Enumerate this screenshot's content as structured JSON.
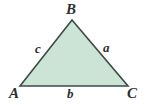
{
  "figure": {
    "kind": "geometry-diagram",
    "shape": "triangle",
    "width": 146,
    "height": 105,
    "background_color": "#ffffff",
    "fill_color": "#cce4d6",
    "stroke_color": "#3d4a47",
    "stroke_width": 1.6,
    "label_color": "#2f2f2f"
  },
  "vertices": [
    {
      "name": "A",
      "label": "A",
      "x": 20,
      "y": 86
    },
    {
      "name": "B",
      "label": "B",
      "x": 72,
      "y": 20
    },
    {
      "name": "C",
      "label": "C",
      "x": 128,
      "y": 86
    }
  ],
  "sides": [
    {
      "name": "a",
      "label": "a",
      "between": "B-C"
    },
    {
      "name": "b",
      "label": "b",
      "between": "A-C"
    },
    {
      "name": "c",
      "label": "c",
      "between": "A-B"
    }
  ],
  "polygon_points": "20,86 72,20 128,86"
}
